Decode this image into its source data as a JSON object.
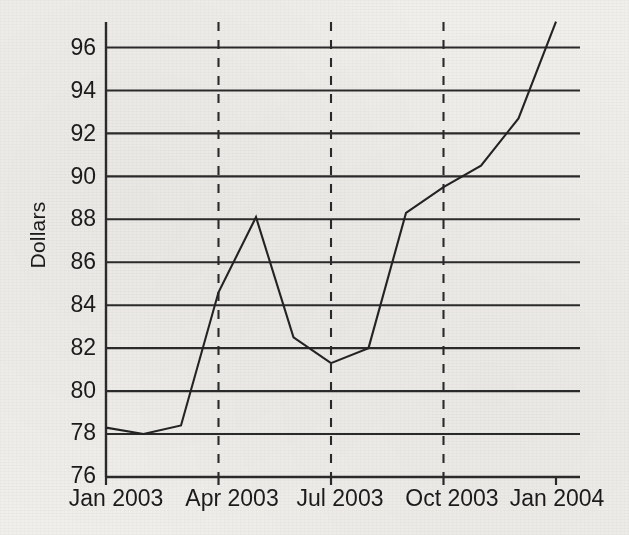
{
  "chart_data": {
    "type": "line",
    "title": "",
    "xlabel": "",
    "ylabel": "Dollars",
    "ylim": [
      76,
      97.6
    ],
    "ytick_values": [
      76,
      78,
      80,
      82,
      84,
      86,
      88,
      90,
      92,
      94,
      96
    ],
    "ytick_labels": [
      "76",
      "78",
      "80",
      "82",
      "84",
      "86",
      "88",
      "90",
      "92",
      "94",
      "96"
    ],
    "xtick_labels": [
      "Jan 2003",
      "Apr 2003",
      "Jul 2003",
      "Oct 2003",
      "Jan 2004"
    ],
    "xtick_values": [
      "2003-01",
      "2003-04",
      "2003-07",
      "2003-10",
      "2004-01"
    ],
    "grid": "horizontal-only",
    "vertical_dashed_gridlines_at": [
      "2003-04",
      "2003-07",
      "2003-10"
    ],
    "legend": "none",
    "x": [
      "2003-01",
      "2003-02",
      "2003-03",
      "2003-04",
      "2003-05",
      "2003-06",
      "2003-07",
      "2003-08",
      "2003-09",
      "2003-10",
      "2003-11",
      "2003-12",
      "2004-01"
    ],
    "x_labels": [
      "Jan 2003",
      "Feb 2003",
      "Mar 2003",
      "Apr 2003",
      "May 2003",
      "Jun 2003",
      "Jul 2003",
      "Aug 2003",
      "Sep 2003",
      "Oct 2003",
      "Nov 2003",
      "Dec 2003",
      "Jan 2004"
    ],
    "series": [
      {
        "name": "Dollars",
        "values": [
          78.3,
          78.0,
          78.4,
          84.6,
          88.1,
          82.5,
          81.3,
          82.0,
          88.3,
          89.5,
          90.5,
          92.7,
          97.2
        ],
        "color": "#232323"
      }
    ],
    "line_color": "#232323",
    "grid_color": "#2a2a2a",
    "axis_color": "#2a2a2a",
    "background_color": "#f1efeb"
  },
  "axis": {
    "y_title": "Dollars"
  }
}
